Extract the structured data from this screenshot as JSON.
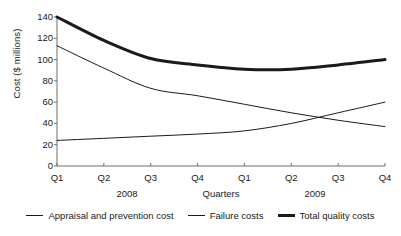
{
  "chart_data": {
    "type": "line",
    "title": "",
    "xlabel": "Quarters",
    "ylabel": "Cost ($ millions)",
    "categories": [
      "Q1",
      "Q2",
      "Q3",
      "Q4",
      "Q1",
      "Q2",
      "Q3",
      "Q4"
    ],
    "group_labels": [
      "2008",
      "2009"
    ],
    "ylim": [
      0,
      140
    ],
    "yticks": [
      0,
      20,
      40,
      60,
      80,
      100,
      120,
      140
    ],
    "ytick_labels": [
      "0",
      "20",
      "40",
      "60",
      "80",
      "100",
      "120",
      "140"
    ],
    "grid": false,
    "legend_position": "bottom",
    "series": [
      {
        "name": "Appraisal and prevention cost",
        "style": "thin",
        "values": [
          24,
          26,
          28,
          30,
          33,
          40,
          50,
          60
        ]
      },
      {
        "name": "Failure costs",
        "style": "thin",
        "values": [
          113,
          92,
          73,
          66,
          58,
          50,
          43,
          37
        ]
      },
      {
        "name": "Total quality costs",
        "style": "thick",
        "values": [
          140,
          118,
          101,
          95,
          91,
          91,
          95,
          100
        ]
      }
    ]
  },
  "axes": {
    "y_title": "Cost ($ millions)",
    "x_title": "Quarters",
    "year_left": "2008",
    "year_right": "2009"
  },
  "legend": {
    "items": [
      {
        "label": "Appraisal and prevention cost",
        "style": "thin"
      },
      {
        "label": "Failure costs",
        "style": "thin"
      },
      {
        "label": "Total quality costs",
        "style": "thick"
      }
    ]
  },
  "colors": {
    "ink": "#1a1a1a",
    "axis": "#6e6e6e",
    "background": "#ffffff"
  }
}
